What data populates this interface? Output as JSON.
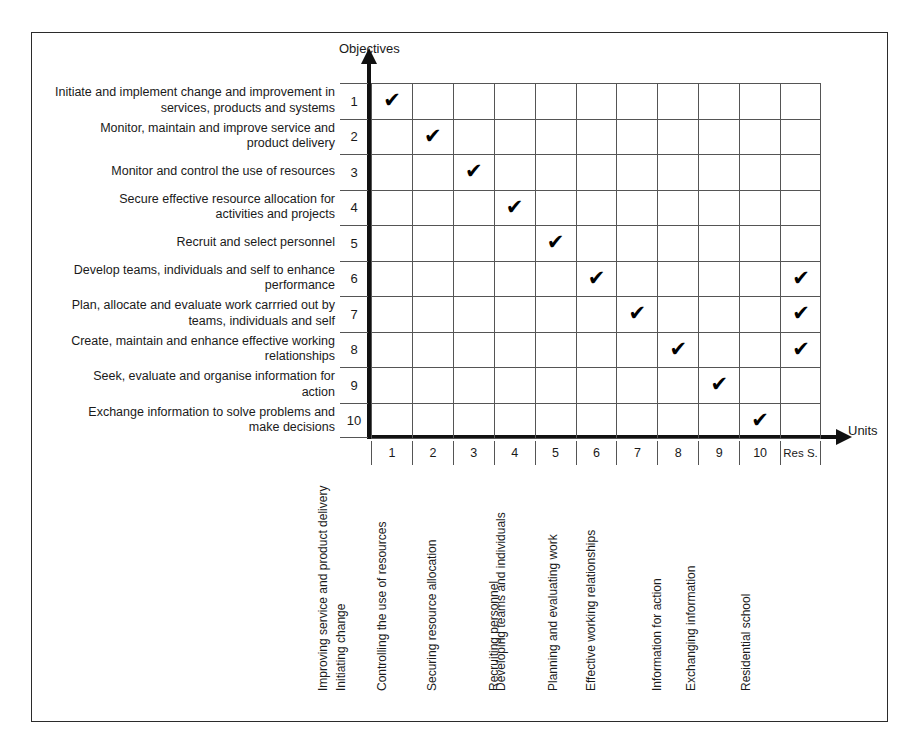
{
  "figure": {
    "y_axis_title": "Objectives",
    "x_axis_title": "Units"
  },
  "chart_data": {
    "type": "heatmap",
    "title": "",
    "xlabel": "Units",
    "ylabel": "Objectives",
    "grid": true,
    "legend": "none",
    "row_numbers": [
      "1",
      "2",
      "3",
      "4",
      "5",
      "6",
      "7",
      "8",
      "9",
      "10"
    ],
    "column_numbers": [
      "1",
      "2",
      "3",
      "4",
      "5",
      "6",
      "7",
      "8",
      "9",
      "10",
      "Res S."
    ],
    "row_labels": [
      "Initiate and implement change and improvement in services, products and systems",
      "Monitor, maintain and improve service and product delivery",
      "Monitor and control the use of resources",
      "Secure effective resource allocation for activities and projects",
      "Recruit and select personnel",
      "Develop teams, individuals and self to enhance performance",
      "Plan, allocate and evaluate work carrried out by teams, individuals and self",
      "Create, maintain and enhance effective working relationships",
      "Seek, evaluate and organise information for action",
      "Exchange information to solve problems and make decisions"
    ],
    "row_labels_lines": [
      [
        "Initiate and implement change and improvement in",
        "services, products and systems"
      ],
      [
        "Monitor, maintain and improve service and",
        "product delivery"
      ],
      [
        "Monitor and control the use of resources"
      ],
      [
        "Secure effective resource allocation for",
        "activities and projects"
      ],
      [
        "Recruit and select personnel"
      ],
      [
        "Develop teams, individuals and self to enhance",
        "performance"
      ],
      [
        "Plan, allocate and evaluate work carrried out by",
        "teams, individuals and self"
      ],
      [
        "Create, maintain and enhance effective working",
        "relationships"
      ],
      [
        "Seek, evaluate and organise information for",
        "action"
      ],
      [
        "Exchange information to solve problems and",
        "make decisions"
      ]
    ],
    "column_labels": [
      "Initiating change",
      "Improving service and product delivery",
      "Controlling the use of resources",
      "Securing resource allocation",
      "Recruiting personnel",
      "Developing teams and individuals",
      "Planning and evaluating work",
      "Effective working relationships",
      "Information for action",
      "Exchanging information",
      "Residential school"
    ],
    "check_glyph": "✔",
    "matrix": [
      [
        1,
        0,
        0,
        0,
        0,
        0,
        0,
        0,
        0,
        0,
        0
      ],
      [
        0,
        1,
        0,
        0,
        0,
        0,
        0,
        0,
        0,
        0,
        0
      ],
      [
        0,
        0,
        1,
        0,
        0,
        0,
        0,
        0,
        0,
        0,
        0
      ],
      [
        0,
        0,
        0,
        1,
        0,
        0,
        0,
        0,
        0,
        0,
        0
      ],
      [
        0,
        0,
        0,
        0,
        1,
        0,
        0,
        0,
        0,
        0,
        0
      ],
      [
        0,
        0,
        0,
        0,
        0,
        1,
        0,
        0,
        0,
        0,
        1
      ],
      [
        0,
        0,
        0,
        0,
        0,
        0,
        1,
        0,
        0,
        0,
        1
      ],
      [
        0,
        0,
        0,
        0,
        0,
        0,
        0,
        1,
        0,
        0,
        1
      ],
      [
        0,
        0,
        0,
        0,
        0,
        0,
        0,
        0,
        1,
        0,
        0
      ],
      [
        0,
        0,
        0,
        0,
        0,
        0,
        0,
        0,
        0,
        1,
        0
      ]
    ],
    "colors": {
      "frame": "#2b2b2b",
      "grid_line": "#555555",
      "axis": "#111111",
      "text": "#1a1a1a",
      "check": "#000000",
      "background": "#ffffff"
    }
  }
}
